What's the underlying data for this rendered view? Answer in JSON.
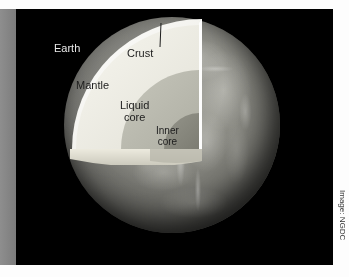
{
  "figure": {
    "background_color": "#000000",
    "plate_border_color": "#ffffff",
    "left_bar_color": "#878787"
  },
  "labels": {
    "earth": "Earth",
    "crust": "Crust",
    "mantle": "Mantle",
    "liquid_core_line1": "Liquid",
    "liquid_core_line2": "core",
    "inner_core_line1": "Inner",
    "inner_core_line2": "core"
  },
  "credit": {
    "text": "Image: NGDC"
  },
  "layers": [
    {
      "name": "crust",
      "label": "Crust",
      "color": "#f2f1ea"
    },
    {
      "name": "mantle",
      "label": "Mantle",
      "color": "#efeee6"
    },
    {
      "name": "liquid-core",
      "label": "Liquid core",
      "color": "#b9b9ae"
    },
    {
      "name": "inner-core",
      "label": "Inner core",
      "color": "#8a8a80"
    }
  ],
  "globe": {
    "surface_color": "#8b8b84",
    "shadow_color": "#1a1a19"
  }
}
